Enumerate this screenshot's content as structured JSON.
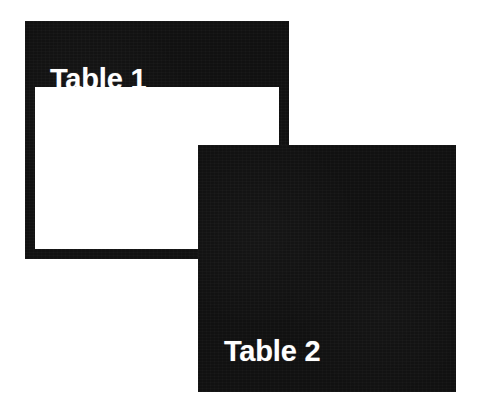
{
  "diagram": {
    "background_color": "#ffffff",
    "shape_fill_color": "#111111",
    "shape_interior_color": "#ffffff",
    "label_color": "#ffffff",
    "shapes": [
      {
        "id": "table-1",
        "label": "Table 1",
        "style": "outlined",
        "x": 25,
        "y": 21,
        "width": 264,
        "height": 238,
        "header_height": 66,
        "border_width": 10,
        "label_x": 25,
        "label_y": 44
      },
      {
        "id": "table-2",
        "label": "Table 2",
        "style": "filled",
        "x": 198,
        "y": 145,
        "width": 258,
        "height": 247,
        "label_x": 26,
        "label_y": 192
      }
    ]
  }
}
